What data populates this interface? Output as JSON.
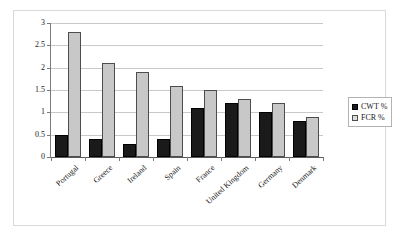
{
  "chart_data": {
    "type": "bar",
    "title": "",
    "subtitle": "",
    "xlabel": "",
    "ylabel": "",
    "ylim": [
      0,
      3
    ],
    "yticks": [
      "0",
      "0.5",
      "1",
      "1.5",
      "2",
      "2.5",
      "3"
    ],
    "ytick_values": [
      0,
      0.5,
      1,
      1.5,
      2,
      2.5,
      3
    ],
    "grid": "horizontal",
    "legend_position": "right",
    "categories": [
      "Portugal",
      "Greece",
      "Ireland",
      "Spain",
      "France",
      "United Kingdom",
      "Germany",
      "Denmark"
    ],
    "series": [
      {
        "name": "CWT %",
        "color": "#1a1a1a",
        "values": [
          0.5,
          0.4,
          0.3,
          0.4,
          1.1,
          1.2,
          1.0,
          0.8
        ]
      },
      {
        "name": "FCR %",
        "color": "#c8c8c8",
        "values": [
          2.8,
          2.1,
          1.9,
          1.6,
          1.5,
          1.3,
          1.2,
          0.9
        ]
      }
    ]
  },
  "legend": {
    "entries": [
      {
        "label": "CWT %"
      },
      {
        "label": "FCR %"
      }
    ]
  }
}
